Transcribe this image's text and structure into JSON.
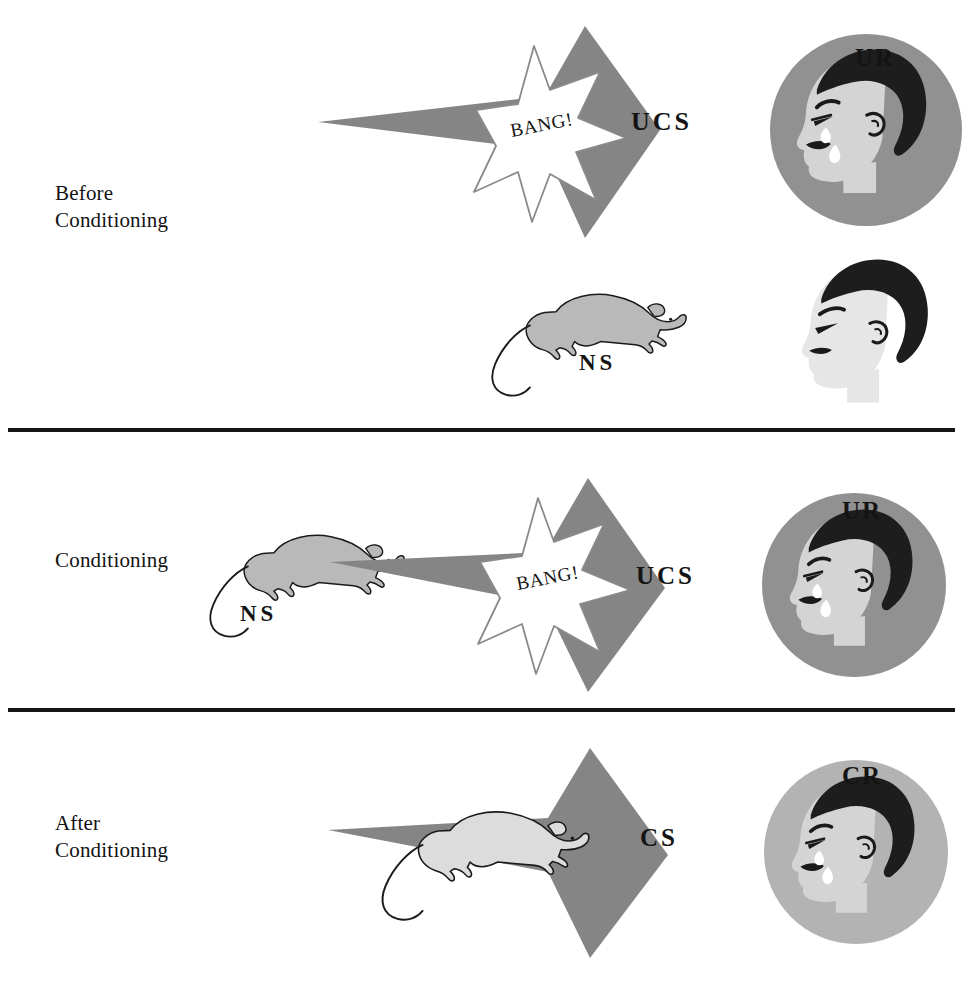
{
  "figure": {
    "title_fragment": "",
    "type": "classical-conditioning-diagram",
    "background_color": "#ffffff"
  },
  "palette": {
    "arrow_gray": "#858585",
    "circle_gray_dark": "#919191",
    "circle_gray_light": "#b3b3b3",
    "rat_gray": "#b9b9b9",
    "rat_light": "#d8d8d8",
    "skin_gray": "#d4d4d4",
    "hair_black": "#1d1d1d",
    "ink": "#141414",
    "star_white": "#ffffff"
  },
  "rows": [
    {
      "id": "before-conditioning",
      "label": "Before\nConditioning",
      "elements": {
        "arrow_label": "UCS",
        "burst_label": "BANG!",
        "response_label": "UR",
        "neutral_label": "NS"
      }
    },
    {
      "id": "conditioning",
      "label": "Conditioning",
      "elements": {
        "arrow_label": "UCS",
        "burst_label": "BANG!",
        "response_label": "UR",
        "neutral_label": "NS"
      }
    },
    {
      "id": "after-conditioning",
      "label": "After\nConditioning",
      "elements": {
        "arrow_label": "CS",
        "response_label": "CR"
      }
    }
  ],
  "icons": {
    "rat": "rat-icon",
    "crying_face": "crying-child-face-icon",
    "neutral_face": "neutral-child-face-icon",
    "burst": "starburst-icon",
    "arrow": "right-arrow-icon"
  },
  "dividers": [
    {
      "id": "divider-1"
    },
    {
      "id": "divider-2"
    }
  ]
}
